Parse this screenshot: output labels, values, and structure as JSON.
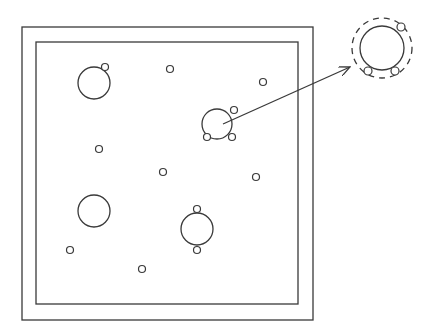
{
  "diagram": {
    "stroke_color": "#3a3a3a",
    "background": "#ffffff",
    "frame": {
      "outer": {
        "x": 22,
        "y": 27,
        "w": 291,
        "h": 293
      },
      "inner": {
        "x": 36,
        "y": 42,
        "w": 262,
        "h": 262
      }
    },
    "large_circles": [
      {
        "id": "top-left",
        "cx": 94,
        "cy": 83,
        "r": 16,
        "satellites": [
          {
            "cx": 105,
            "cy": 67
          }
        ]
      },
      {
        "id": "center",
        "cx": 217,
        "cy": 124,
        "r": 15,
        "satellites": [
          {
            "cx": 234,
            "cy": 110
          },
          {
            "cx": 207,
            "cy": 137
          },
          {
            "cx": 232,
            "cy": 137
          }
        ]
      },
      {
        "id": "bottom-left",
        "cx": 94,
        "cy": 211,
        "r": 16,
        "satellites": []
      },
      {
        "id": "bottom-center",
        "cx": 197,
        "cy": 229,
        "r": 16,
        "satellites": [
          {
            "cx": 197,
            "cy": 209
          },
          {
            "cx": 197,
            "cy": 250
          }
        ]
      }
    ],
    "small_circles": [
      {
        "cx": 170,
        "cy": 69
      },
      {
        "cx": 263,
        "cy": 82
      },
      {
        "cx": 99,
        "cy": 149
      },
      {
        "cx": 163,
        "cy": 172
      },
      {
        "cx": 256,
        "cy": 177
      },
      {
        "cx": 70,
        "cy": 250
      },
      {
        "cx": 142,
        "cy": 269
      }
    ],
    "small_radius": 3.5,
    "arrow": {
      "x1": 223,
      "y1": 124,
      "x2": 350,
      "y2": 67
    },
    "detail": {
      "cx": 382,
      "cy": 48,
      "r": 22,
      "dashed_r": 30,
      "satellites": [
        {
          "cx": 401,
          "cy": 27
        },
        {
          "cx": 368,
          "cy": 71
        },
        {
          "cx": 395,
          "cy": 71
        }
      ]
    }
  }
}
